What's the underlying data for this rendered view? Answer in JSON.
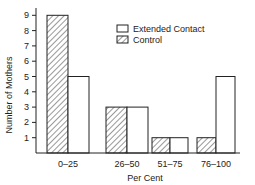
{
  "chart_data": {
    "type": "bar",
    "title": "",
    "xlabel": "Per Cent",
    "ylabel": "Number of Mothers",
    "categories": [
      "0–25",
      "26–50",
      "51–75",
      "76–100"
    ],
    "series": [
      {
        "name": "Control",
        "pattern": "hatched",
        "values": [
          9,
          3,
          1,
          1
        ]
      },
      {
        "name": "Extended Contact",
        "pattern": "open",
        "values": [
          5,
          3,
          1,
          5
        ]
      }
    ],
    "yticks": [
      1,
      2,
      3,
      4,
      5,
      6,
      7,
      8,
      9
    ],
    "ylim": [
      0,
      9.6
    ],
    "grid": false,
    "legend_position": "upper-right",
    "legend_order": [
      "Extended Contact",
      "Control"
    ]
  },
  "colors": {
    "stroke": "#222222",
    "fill_open": "#ffffff",
    "hatch": "#333333"
  }
}
